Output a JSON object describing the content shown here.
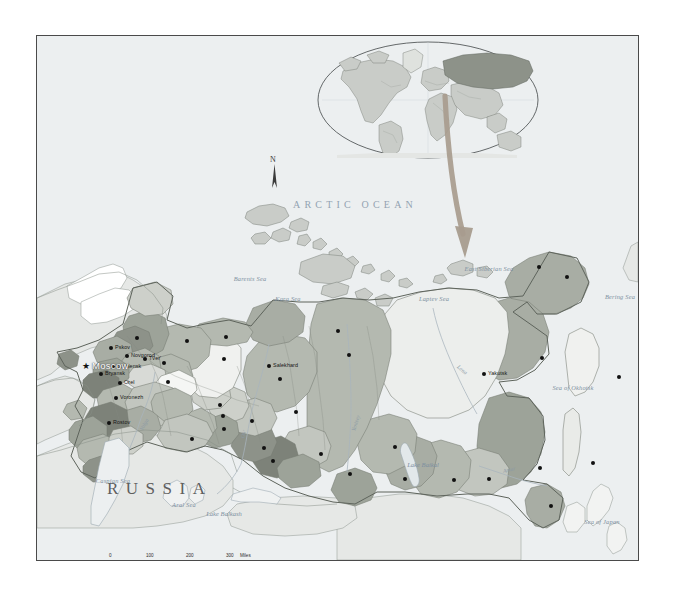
{
  "map": {
    "title": "RUSSIA",
    "north_arrow_label": "N",
    "ocean_label": "ARCTIC OCEAN",
    "capital": {
      "name": "Moscow",
      "marker": "star"
    },
    "seas": [
      {
        "name": "Barents Sea",
        "x": 213,
        "y": 239
      },
      {
        "name": "Kara Sea",
        "x": 251,
        "y": 259
      },
      {
        "name": "Laptev Sea",
        "x": 397,
        "y": 259
      },
      {
        "name": "East Siberian Sea",
        "x": 452,
        "y": 229
      },
      {
        "name": "Bering Sea",
        "x": 583,
        "y": 257
      },
      {
        "name": "Sea of Okhotsk",
        "x": 536,
        "y": 348
      },
      {
        "name": "Sea of Japan",
        "x": 565,
        "y": 482
      },
      {
        "name": "Caspian Sea",
        "x": 76,
        "y": 441
      },
      {
        "name": "Aral Sea",
        "x": 147,
        "y": 465
      },
      {
        "name": "Lake Balkash",
        "x": 187,
        "y": 474
      },
      {
        "name": "Lake Baikal",
        "x": 386,
        "y": 425
      }
    ],
    "rivers": [
      {
        "name": "Volga",
        "x": 104,
        "y": 391
      },
      {
        "name": "Ob'",
        "x": 205,
        "y": 399
      },
      {
        "name": "Yenisey",
        "x": 316,
        "y": 392
      },
      {
        "name": "Lena",
        "x": 421,
        "y": 327
      },
      {
        "name": "Amur",
        "x": 466,
        "y": 432
      }
    ],
    "cities": [
      {
        "name": "St. Petersburg",
        "x": 100,
        "y": 302,
        "anchor": "right"
      },
      {
        "name": "Pskov",
        "x": 74,
        "y": 312,
        "anchor": "left"
      },
      {
        "name": "Novgorod",
        "x": 90,
        "y": 320,
        "anchor": "left"
      },
      {
        "name": "Smolensk",
        "x": 76,
        "y": 331,
        "anchor": "left"
      },
      {
        "name": "Bryansk",
        "x": 64,
        "y": 338,
        "anchor": "left"
      },
      {
        "name": "Tver'",
        "x": 108,
        "y": 323,
        "anchor": "left"
      },
      {
        "name": "Orel",
        "x": 83,
        "y": 347,
        "anchor": "left"
      },
      {
        "name": "Voronezh",
        "x": 79,
        "y": 362,
        "anchor": "left"
      },
      {
        "name": "Rostov",
        "x": 72,
        "y": 387,
        "anchor": "left"
      },
      {
        "name": "Arkhangel'sk",
        "x": 150,
        "y": 305,
        "anchor": "right"
      },
      {
        "name": "Nar'yan-Mar",
        "x": 189,
        "y": 301,
        "anchor": "right"
      },
      {
        "name": "Vologda",
        "x": 127,
        "y": 327,
        "anchor": "right"
      },
      {
        "name": "Nizhniy Novgorod",
        "x": 131,
        "y": 346,
        "anchor": "right"
      },
      {
        "name": "Pechora",
        "x": 187,
        "y": 323,
        "anchor": "right"
      },
      {
        "name": "Salekhard",
        "x": 232,
        "y": 330,
        "anchor": "left"
      },
      {
        "name": "Perm'",
        "x": 183,
        "y": 369,
        "anchor": "right"
      },
      {
        "name": "Yekaterinburg",
        "x": 186,
        "y": 380,
        "anchor": "right"
      },
      {
        "name": "Chelyabinsk",
        "x": 187,
        "y": 393,
        "anchor": "right"
      },
      {
        "name": "Tyumen'",
        "x": 215,
        "y": 385,
        "anchor": "right"
      },
      {
        "name": "Nadym",
        "x": 243,
        "y": 343,
        "anchor": "right"
      },
      {
        "name": "Dikson",
        "x": 301,
        "y": 295,
        "anchor": "right"
      },
      {
        "name": "Noril'sk",
        "x": 312,
        "y": 319,
        "anchor": "right"
      },
      {
        "name": "Surgut",
        "x": 259,
        "y": 376,
        "anchor": "right"
      },
      {
        "name": "Omsk",
        "x": 227,
        "y": 412,
        "anchor": "right"
      },
      {
        "name": "Novosibirsk",
        "x": 236,
        "y": 425,
        "anchor": "right"
      },
      {
        "name": "Orenburg",
        "x": 155,
        "y": 403,
        "anchor": "right"
      },
      {
        "name": "Tomsk",
        "x": 284,
        "y": 418,
        "anchor": "right"
      },
      {
        "name": "Krasnoyarsk",
        "x": 313,
        "y": 438,
        "anchor": "right"
      },
      {
        "name": "Ust'Ilimsk",
        "x": 358,
        "y": 411,
        "anchor": "right"
      },
      {
        "name": "Irkutsk",
        "x": 368,
        "y": 443,
        "anchor": "right"
      },
      {
        "name": "Chita",
        "x": 417,
        "y": 444,
        "anchor": "right"
      },
      {
        "name": "Blagoveshchensk",
        "x": 452,
        "y": 443,
        "anchor": "right"
      },
      {
        "name": "Yakutsk",
        "x": 447,
        "y": 338,
        "anchor": "left"
      },
      {
        "name": "Magadan",
        "x": 505,
        "y": 322,
        "anchor": "right"
      },
      {
        "name": "Pevek",
        "x": 502,
        "y": 231,
        "anchor": "right"
      },
      {
        "name": "Anadyr'",
        "x": 530,
        "y": 241,
        "anchor": "right"
      },
      {
        "name": "Petropavlovsk-Kamchatskiy",
        "x": 582,
        "y": 341,
        "anchor": "right"
      },
      {
        "name": "Khabarovsk",
        "x": 503,
        "y": 432,
        "anchor": "right"
      },
      {
        "name": "Yuzhno-Sakhalinsk",
        "x": 556,
        "y": 427,
        "anchor": "right"
      },
      {
        "name": "Vladivostok",
        "x": 514,
        "y": 470,
        "anchor": "right"
      }
    ],
    "scale": {
      "miles_ticks": [
        "0",
        "100",
        "200",
        "300"
      ],
      "miles_unit": "Miles",
      "kilometers_ticks": [
        "0",
        "100",
        "200",
        "300"
      ],
      "kilometers_unit": "Kilometers"
    },
    "colors": {
      "background": "#eceff0",
      "ocean": "#eceff0",
      "neighbor_land": "#e4e6e5",
      "russia_light": "#d8dad6",
      "russia_mid": "#b8bdb4",
      "russia_dark": "#999e94",
      "russia_darker": "#7d8279",
      "border_line": "#6a6f68",
      "coast_line": "#6e7670",
      "water_text": "#7d8fa0",
      "frame": "#4a4a4a",
      "inset_highlight": "#8d9289",
      "arrow": "#9b9083"
    }
  }
}
